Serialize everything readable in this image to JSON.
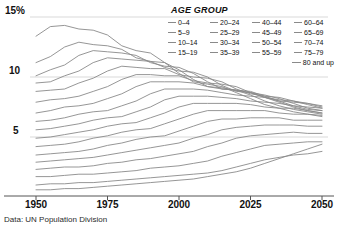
{
  "legend": {
    "title": "AGE GROUP",
    "items": [
      {
        "label": "0–4"
      },
      {
        "label": "20–24"
      },
      {
        "label": "40–44"
      },
      {
        "label": "60–64"
      },
      {
        "label": "5–9"
      },
      {
        "label": "25–29"
      },
      {
        "label": "45–49"
      },
      {
        "label": "65–69"
      },
      {
        "label": "10–14"
      },
      {
        "label": "30–34"
      },
      {
        "label": "50–54"
      },
      {
        "label": "70–74"
      },
      {
        "label": "15–19"
      },
      {
        "label": "35–39"
      },
      {
        "label": "55–59"
      },
      {
        "label": "75–79"
      }
    ],
    "last_item": {
      "label": "80 and up"
    }
  },
  "source": "Data: UN Population Division",
  "axes": {
    "y_ticks": [
      {
        "label": "15%",
        "value": 15
      },
      {
        "label": "10",
        "value": 10
      },
      {
        "label": "5",
        "value": 5
      }
    ],
    "x_ticks": [
      {
        "label": "1950",
        "value": 1950
      },
      {
        "label": "1975",
        "value": 1975
      },
      {
        "label": "2000",
        "value": 2000
      },
      {
        "label": "2025",
        "value": 2025
      },
      {
        "label": "2050",
        "value": 2050
      }
    ]
  },
  "colors": {
    "line": "#8a8a8a",
    "grid": "#cfcfcf",
    "axis": "#555555",
    "text": "#111111"
  },
  "chart_data": {
    "type": "line",
    "title": "",
    "subtitle": "",
    "xlabel": "",
    "ylabel": "",
    "xlim": [
      1950,
      2050
    ],
    "ylim": [
      0,
      15.5
    ],
    "grid": "horizontal",
    "legend_position": "top-right",
    "x": [
      1950,
      1955,
      1960,
      1965,
      1970,
      1975,
      1980,
      1985,
      1990,
      1995,
      2000,
      2005,
      2010,
      2015,
      2020,
      2025,
      2030,
      2035,
      2040,
      2045,
      2050
    ],
    "series": [
      {
        "name": "0–4",
        "values": [
          13.4,
          14.2,
          14.3,
          14.0,
          13.9,
          13.5,
          12.6,
          12.2,
          12.0,
          11.2,
          10.3,
          9.6,
          9.4,
          9.2,
          8.7,
          8.2,
          7.7,
          7.4,
          7.1,
          6.9,
          6.7
        ]
      },
      {
        "name": "5–9",
        "values": [
          11.2,
          11.7,
          12.5,
          12.9,
          12.7,
          12.6,
          12.3,
          11.6,
          11.3,
          11.2,
          10.6,
          9.8,
          9.2,
          9.1,
          8.9,
          8.5,
          8.0,
          7.6,
          7.3,
          7.1,
          6.9
        ]
      },
      {
        "name": "10–14",
        "values": [
          10.1,
          10.6,
          11.0,
          11.8,
          12.2,
          12.1,
          12.0,
          11.8,
          11.2,
          10.9,
          10.8,
          10.3,
          9.6,
          9.0,
          8.9,
          8.7,
          8.3,
          7.9,
          7.5,
          7.2,
          7.0
        ]
      },
      {
        "name": "15–19",
        "values": [
          9.5,
          9.6,
          10.1,
          10.5,
          11.2,
          11.6,
          11.5,
          11.4,
          11.3,
          10.8,
          10.5,
          10.4,
          10.0,
          9.3,
          8.8,
          8.7,
          8.5,
          8.2,
          7.8,
          7.4,
          7.2
        ]
      },
      {
        "name": "20–24",
        "values": [
          8.8,
          8.9,
          9.0,
          9.5,
          9.9,
          10.5,
          10.9,
          10.8,
          10.7,
          10.7,
          10.2,
          10.0,
          9.9,
          9.6,
          9.0,
          8.6,
          8.4,
          8.3,
          8.0,
          7.7,
          7.4
        ]
      },
      {
        "name": "25–29",
        "values": [
          7.9,
          8.1,
          8.2,
          8.4,
          8.8,
          9.2,
          9.8,
          10.2,
          10.2,
          10.1,
          10.1,
          9.7,
          9.5,
          9.4,
          9.2,
          8.7,
          8.3,
          8.1,
          8.0,
          7.8,
          7.5
        ]
      },
      {
        "name": "30–34",
        "values": [
          7.0,
          7.2,
          7.5,
          7.6,
          7.8,
          8.2,
          8.6,
          9.2,
          9.6,
          9.6,
          9.6,
          9.5,
          9.2,
          9.0,
          8.9,
          8.8,
          8.4,
          8.0,
          7.9,
          7.8,
          7.6
        ]
      },
      {
        "name": "35–39",
        "values": [
          6.3,
          6.4,
          6.6,
          6.9,
          7.1,
          7.2,
          7.6,
          8.0,
          8.6,
          9.0,
          9.0,
          9.0,
          8.9,
          8.7,
          8.5,
          8.4,
          8.3,
          8.0,
          7.6,
          7.5,
          7.4
        ]
      },
      {
        "name": "40–44",
        "values": [
          5.6,
          5.7,
          5.9,
          6.1,
          6.4,
          6.6,
          6.7,
          7.1,
          7.5,
          8.1,
          8.4,
          8.4,
          8.4,
          8.3,
          8.2,
          8.0,
          7.9,
          7.8,
          7.6,
          7.3,
          7.2
        ]
      },
      {
        "name": "45–49",
        "values": [
          4.9,
          5.0,
          5.2,
          5.4,
          5.6,
          5.9,
          6.1,
          6.2,
          6.6,
          7.0,
          7.5,
          7.8,
          7.8,
          7.8,
          7.8,
          7.7,
          7.5,
          7.4,
          7.4,
          7.2,
          7.0
        ]
      },
      {
        "name": "50–54",
        "values": [
          4.2,
          4.3,
          4.4,
          4.6,
          4.9,
          5.1,
          5.4,
          5.6,
          5.7,
          6.1,
          6.5,
          6.9,
          7.2,
          7.2,
          7.2,
          7.2,
          7.2,
          7.0,
          6.9,
          6.9,
          6.8
        ]
      },
      {
        "name": "55–59",
        "values": [
          3.5,
          3.6,
          3.7,
          3.8,
          4.0,
          4.3,
          4.5,
          4.8,
          5.0,
          5.1,
          5.5,
          5.9,
          6.3,
          6.5,
          6.5,
          6.6,
          6.6,
          6.6,
          6.4,
          6.4,
          6.4
        ]
      },
      {
        "name": "60–64",
        "values": [
          2.9,
          3.0,
          3.1,
          3.2,
          3.3,
          3.5,
          3.7,
          3.9,
          4.1,
          4.3,
          4.5,
          4.9,
          5.2,
          5.6,
          5.8,
          5.9,
          6.0,
          6.0,
          6.0,
          5.9,
          5.9
        ]
      },
      {
        "name": "65–69",
        "values": [
          2.3,
          2.4,
          2.5,
          2.5,
          2.6,
          2.8,
          2.9,
          3.1,
          3.2,
          3.4,
          3.6,
          3.8,
          4.2,
          4.5,
          4.9,
          5.1,
          5.2,
          5.3,
          5.4,
          5.3,
          5.3
        ]
      },
      {
        "name": "70–74",
        "values": [
          1.7,
          1.7,
          1.8,
          1.9,
          1.9,
          2.0,
          2.1,
          2.2,
          2.4,
          2.5,
          2.6,
          2.8,
          3.0,
          3.4,
          3.7,
          4.0,
          4.3,
          4.4,
          4.5,
          4.6,
          4.6
        ]
      },
      {
        "name": "75–79",
        "values": [
          1.0,
          1.1,
          1.1,
          1.2,
          1.2,
          1.3,
          1.4,
          1.5,
          1.6,
          1.7,
          1.8,
          1.9,
          2.0,
          2.2,
          2.5,
          2.8,
          3.1,
          3.3,
          3.5,
          3.6,
          3.8
        ]
      },
      {
        "name": "80 and up",
        "values": [
          0.6,
          0.6,
          0.7,
          0.7,
          0.8,
          0.9,
          1.0,
          1.1,
          1.2,
          1.3,
          1.4,
          1.5,
          1.7,
          1.9,
          2.1,
          2.4,
          2.8,
          3.2,
          3.6,
          4.0,
          4.4
        ]
      }
    ]
  }
}
